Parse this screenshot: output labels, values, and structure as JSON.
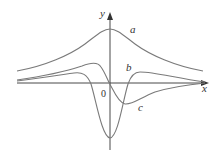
{
  "figure": {
    "axes": {
      "x_label": "x",
      "y_label": "y",
      "origin_label": "0"
    },
    "curves": [
      {
        "id": "a",
        "label": "a",
        "description": "bell-shaped positive curve with peak on y-axis"
      },
      {
        "id": "b",
        "label": "b",
        "description": "odd-like curve: local max left of origin, passes through origin, local min right of origin"
      },
      {
        "id": "c",
        "label": "c",
        "description": "curve with small positive humps on each side and deep minimum on y-axis"
      }
    ],
    "colors": {
      "axis": "#333333",
      "curves": "#7a7a7a",
      "background": "#ffffff"
    }
  }
}
